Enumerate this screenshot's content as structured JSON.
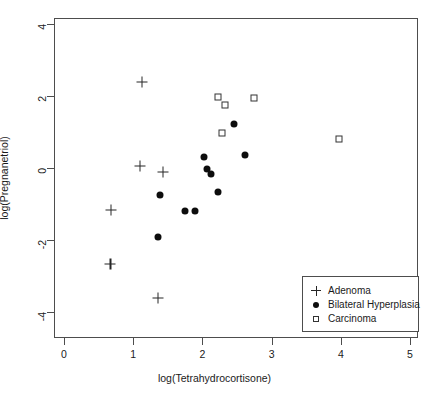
{
  "page": {
    "header_text": ""
  },
  "chart_data": {
    "type": "scatter",
    "title": "",
    "xlabel": "log(Tetrahydrocortisone)",
    "ylabel": "log(Pregnanetriol)",
    "xlim": [
      -0.2,
      5.35
    ],
    "ylim": [
      -4.35,
      4.35
    ],
    "xticks": [
      0,
      1,
      2,
      3,
      4,
      5
    ],
    "yticks": [
      4,
      2,
      0,
      -2,
      -4
    ],
    "xticklabels": [
      "0",
      "1",
      "2",
      "3",
      "4",
      "5"
    ],
    "yticklabels": [
      "4",
      "2",
      "0",
      "-2",
      "-4"
    ],
    "grid": false,
    "legend_position": "bottom-right",
    "series": [
      {
        "name": "Adenoma",
        "marker": "plus",
        "color": "#262626",
        "points": [
          [
            1.13,
            2.4
          ],
          [
            1.1,
            0.06
          ],
          [
            1.43,
            -0.11
          ],
          [
            0.68,
            -1.17
          ],
          [
            0.67,
            -2.67
          ],
          [
            1.36,
            -3.61
          ]
        ]
      },
      {
        "name": "Bilateral Hyperplasia",
        "marker": "filled-circle",
        "color": "#0d0d0d",
        "points": [
          [
            1.39,
            -0.75
          ],
          [
            1.75,
            -1.19
          ],
          [
            1.9,
            -1.19
          ],
          [
            1.36,
            -1.92
          ],
          [
            2.03,
            0.31
          ],
          [
            2.06,
            -0.03
          ],
          [
            2.13,
            -0.17
          ],
          [
            2.23,
            -0.67
          ],
          [
            2.62,
            0.36
          ],
          [
            2.45,
            1.22
          ]
        ]
      },
      {
        "name": "Carcinoma",
        "marker": "open-square",
        "color": "#333333",
        "points": [
          [
            2.23,
            1.97
          ],
          [
            2.32,
            1.75
          ],
          [
            2.75,
            1.94
          ],
          [
            2.28,
            0.97
          ],
          [
            3.97,
            0.81
          ]
        ]
      }
    ]
  }
}
